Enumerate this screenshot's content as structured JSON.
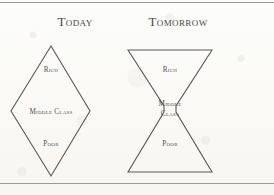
{
  "figure": {
    "background_color": "#fbfbf9",
    "stroke_color": "#59595a",
    "text_color": "#4a4a4a",
    "panels": [
      {
        "caption": "Today",
        "shape": "diamond",
        "labels": {
          "top": "Rich",
          "middle_line1": "Middle Class",
          "middle_line2": "",
          "bottom": "Poor"
        }
      },
      {
        "caption": "Tomorrow",
        "shape": "hourglass",
        "labels": {
          "top": "Rich",
          "middle_line1": "Middle",
          "middle_line2": "Class",
          "bottom": "Poor"
        }
      }
    ]
  }
}
